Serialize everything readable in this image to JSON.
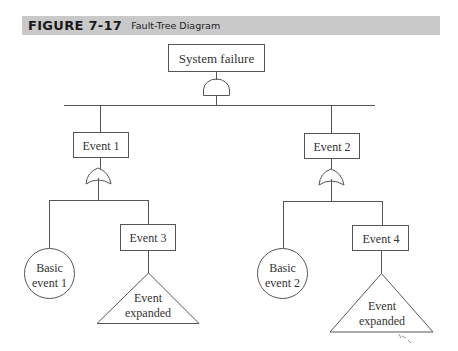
{
  "figure": {
    "number": "FIGURE 7-17",
    "title": "Fault-Tree Diagram"
  },
  "diagram": {
    "top_event": {
      "label": "System failure",
      "gate": "AND"
    },
    "events": [
      {
        "id": "event1",
        "label": "Event 1",
        "gate": "OR"
      },
      {
        "id": "event2",
        "label": "Event 2",
        "gate": "OR"
      },
      {
        "id": "event3",
        "label": "Event 3"
      },
      {
        "id": "event4",
        "label": "Event 4"
      }
    ],
    "basic_events": [
      {
        "id": "basic1",
        "line1": "Basic",
        "line2": "event 1"
      },
      {
        "id": "basic2",
        "line1": "Basic",
        "line2": "event 2"
      }
    ],
    "expanded_events": [
      {
        "id": "exp3",
        "line1": "Event",
        "line2": "expanded"
      },
      {
        "id": "exp4",
        "line1": "Event",
        "line2": "expanded"
      }
    ]
  },
  "colors": {
    "header_bg": "#c9c9c9",
    "line": "#555555",
    "text": "#333333"
  }
}
